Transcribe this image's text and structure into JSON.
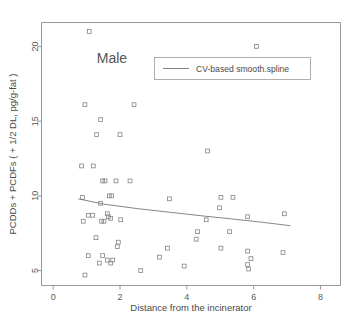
{
  "chart_data": {
    "type": "scatter",
    "title": "Male",
    "xlabel": "Distance from the incinerator",
    "ylabel": "PCDDs + PCDFs ( + 1/2 DL, pg/g-fat )",
    "xlim": [
      -0.35,
      8.6
    ],
    "ylim": [
      4.0,
      21.6
    ],
    "xticks": [
      0,
      2,
      4,
      6,
      8
    ],
    "xtick_labels": [
      "0",
      "2",
      "4",
      "6",
      "8"
    ],
    "yticks": [
      5,
      10,
      15,
      20
    ],
    "ytick_labels": [
      "5",
      "10",
      "15",
      "20"
    ],
    "grid": false,
    "legend_position": "top-center-right",
    "legend": [
      {
        "label": "CV-based smooth.spline",
        "marker": "line",
        "color": "#777777"
      }
    ],
    "series": [
      {
        "name": "Male subjects",
        "marker": "open-square",
        "color": "#8a8a8a",
        "points": [
          [
            1.08,
            21.0
          ],
          [
            6.08,
            20.0
          ],
          [
            0.95,
            16.1
          ],
          [
            2.42,
            16.1
          ],
          [
            1.42,
            15.1
          ],
          [
            1.3,
            14.1
          ],
          [
            2.0,
            14.1
          ],
          [
            4.62,
            13.0
          ],
          [
            0.85,
            12.0
          ],
          [
            1.2,
            12.0
          ],
          [
            1.48,
            11.0
          ],
          [
            1.55,
            11.0
          ],
          [
            1.88,
            11.0
          ],
          [
            2.3,
            11.0
          ],
          [
            0.88,
            9.9
          ],
          [
            1.68,
            10.0
          ],
          [
            1.75,
            10.0
          ],
          [
            3.48,
            9.8
          ],
          [
            5.02,
            9.9
          ],
          [
            5.38,
            9.9
          ],
          [
            1.42,
            9.5
          ],
          [
            4.98,
            9.2
          ],
          [
            1.62,
            8.8
          ],
          [
            1.05,
            8.7
          ],
          [
            1.18,
            8.7
          ],
          [
            6.92,
            8.8
          ],
          [
            1.65,
            8.6
          ],
          [
            1.72,
            8.5
          ],
          [
            2.02,
            8.4
          ],
          [
            4.58,
            8.4
          ],
          [
            5.82,
            8.6
          ],
          [
            0.9,
            8.3
          ],
          [
            1.45,
            8.3
          ],
          [
            1.52,
            8.3
          ],
          [
            4.32,
            7.6
          ],
          [
            5.28,
            7.6
          ],
          [
            1.28,
            7.2
          ],
          [
            4.28,
            7.1
          ],
          [
            1.95,
            6.9
          ],
          [
            1.92,
            6.6
          ],
          [
            3.42,
            6.5
          ],
          [
            5.02,
            6.5
          ],
          [
            5.82,
            6.3
          ],
          [
            6.88,
            6.2
          ],
          [
            1.05,
            6.0
          ],
          [
            1.48,
            6.0
          ],
          [
            3.18,
            5.9
          ],
          [
            5.92,
            5.8
          ],
          [
            1.62,
            5.7
          ],
          [
            1.78,
            5.7
          ],
          [
            1.38,
            5.5
          ],
          [
            1.72,
            5.5
          ],
          [
            3.92,
            5.3
          ],
          [
            5.82,
            5.4
          ],
          [
            5.85,
            5.1
          ],
          [
            2.62,
            5.0
          ],
          [
            0.95,
            4.7
          ]
        ]
      }
    ],
    "fit_line": {
      "name": "CV-based smooth.spline",
      "color": "#777777",
      "points": [
        [
          0.75,
          9.8
        ],
        [
          1.5,
          9.45
        ],
        [
          2.5,
          9.15
        ],
        [
          3.5,
          8.9
        ],
        [
          4.5,
          8.65
        ],
        [
          5.5,
          8.42
        ],
        [
          6.3,
          8.22
        ],
        [
          7.1,
          8.0
        ]
      ]
    },
    "caption_faint": ""
  }
}
